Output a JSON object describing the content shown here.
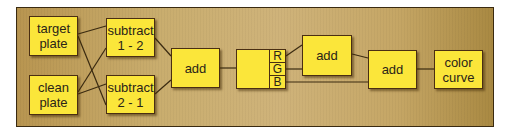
{
  "diagram": {
    "type": "node-graph",
    "colors": {
      "node_fill": "#fbe63a",
      "node_border": "#4a2e12",
      "background": "#c9ad6e",
      "wire": "#3a2a10"
    },
    "nodes": {
      "target_plate": {
        "label": "target\nplate"
      },
      "clean_plate": {
        "label": "clean\nplate"
      },
      "subtract_1_2": {
        "label": "subtract\n1 - 2"
      },
      "subtract_2_1": {
        "label": "subtract\n2 - 1"
      },
      "add_1": {
        "label": "add"
      },
      "rgb_split": {
        "label": "",
        "channels": [
          "R",
          "G",
          "B"
        ]
      },
      "add_2": {
        "label": "add"
      },
      "add_3": {
        "label": "add"
      },
      "color_curve": {
        "label": "color\ncurve"
      }
    },
    "edges": [
      [
        "target_plate",
        "subtract_1_2"
      ],
      [
        "target_plate",
        "subtract_2_1"
      ],
      [
        "clean_plate",
        "subtract_1_2"
      ],
      [
        "clean_plate",
        "subtract_2_1"
      ],
      [
        "subtract_1_2",
        "add_1"
      ],
      [
        "subtract_2_1",
        "add_1"
      ],
      [
        "add_1",
        "rgb_split"
      ],
      [
        "rgb_split.R",
        "add_2"
      ],
      [
        "rgb_split.G",
        "add_2"
      ],
      [
        "rgb_split.B",
        "add_3"
      ],
      [
        "add_2",
        "add_3"
      ],
      [
        "add_3",
        "color_curve"
      ]
    ]
  }
}
